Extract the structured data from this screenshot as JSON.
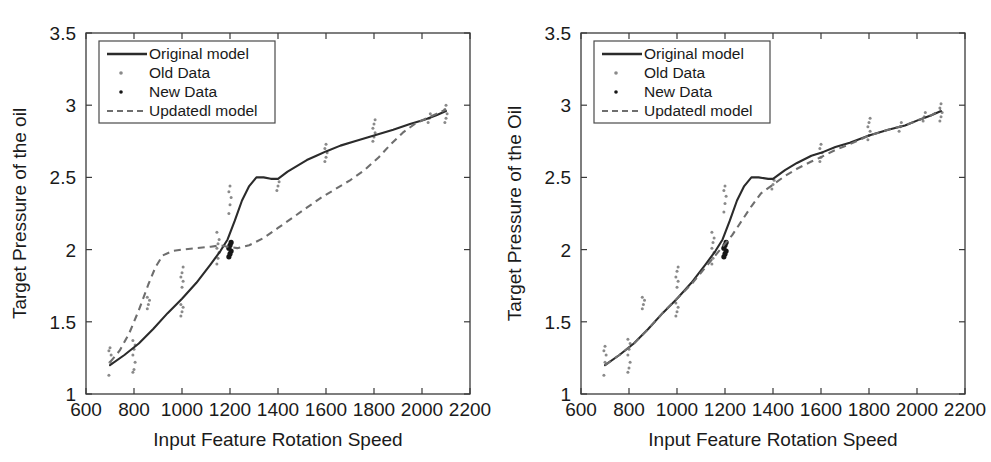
{
  "figure": {
    "panel_count": 2,
    "background": "#ffffff",
    "colors": {
      "original_model_line": "#2b2b2b",
      "updated_model_line": "#6e6e6e",
      "old_data_points": "#8a8a8a",
      "new_data_points": "#161616",
      "axis": "#3a3a3a",
      "text": "#1a1a1a"
    }
  },
  "chart_data": [
    {
      "id": "left",
      "type": "line",
      "title": "",
      "xlabel": "Input Feature Rotation Speed",
      "ylabel": "Target Pressure of the oil",
      "xlim": [
        600,
        2200
      ],
      "ylim": [
        1,
        3.5
      ],
      "xticks": [
        600,
        800,
        1000,
        1200,
        1400,
        1600,
        1800,
        2000,
        2200
      ],
      "xticklabels": [
        "600",
        "800",
        "1000",
        "1200",
        "1400",
        "1600",
        "1800",
        "2000",
        "2200"
      ],
      "yticks": [
        1,
        1.5,
        2,
        2.5,
        3,
        3.5
      ],
      "yticklabels": [
        "1",
        "1.5",
        "2",
        "2.5",
        "3",
        "3.5"
      ],
      "grid": false,
      "legend_position": "upper left",
      "legend_entries": [
        {
          "label": "Original model",
          "marker": "solid-line",
          "color": "#2b2b2b"
        },
        {
          "label": "Old Data",
          "marker": "dot",
          "color": "#8a8a8a"
        },
        {
          "label": "New Data",
          "marker": "dot",
          "color": "#161616"
        },
        {
          "label": "Updatedl model",
          "marker": "dashed-line",
          "color": "#6e6e6e"
        }
      ],
      "series": [
        {
          "name": "Original model",
          "style": "solid",
          "x": [
            700,
            760,
            820,
            880,
            940,
            1000,
            1060,
            1120,
            1160,
            1190,
            1220,
            1250,
            1280,
            1310,
            1340,
            1370,
            1400,
            1440,
            1480,
            1520,
            1560,
            1600,
            1660,
            1720,
            1800,
            1880,
            1950,
            2010,
            2060,
            2100
          ],
          "y": [
            1.2,
            1.27,
            1.35,
            1.45,
            1.56,
            1.66,
            1.77,
            1.9,
            1.99,
            2.07,
            2.2,
            2.34,
            2.44,
            2.5,
            2.5,
            2.49,
            2.49,
            2.54,
            2.58,
            2.62,
            2.65,
            2.68,
            2.72,
            2.75,
            2.79,
            2.83,
            2.87,
            2.9,
            2.93,
            2.96
          ]
        },
        {
          "name": "Updatedl model",
          "style": "dashed",
          "x": [
            700,
            740,
            780,
            820,
            860,
            890,
            920,
            960,
            1000,
            1060,
            1120,
            1160,
            1190,
            1230,
            1280,
            1340,
            1400,
            1460,
            1520,
            1580,
            1640,
            1700,
            1760,
            1820,
            1870,
            1920,
            1970,
            2020,
            2060,
            2100
          ],
          "y": [
            1.22,
            1.3,
            1.42,
            1.58,
            1.76,
            1.88,
            1.96,
            1.99,
            2.0,
            2.01,
            2.02,
            2.03,
            2.02,
            2.01,
            2.03,
            2.08,
            2.15,
            2.22,
            2.29,
            2.36,
            2.42,
            2.48,
            2.55,
            2.64,
            2.73,
            2.81,
            2.87,
            2.91,
            2.94,
            2.97
          ]
        }
      ],
      "old_data": [
        {
          "x": 700,
          "values": [
            1.13,
            1.22,
            1.27,
            1.3,
            1.32
          ]
        },
        {
          "x": 800,
          "values": [
            1.15,
            1.17,
            1.22,
            1.27,
            1.31,
            1.34,
            1.37
          ]
        },
        {
          "x": 860,
          "values": [
            1.59,
            1.62,
            1.65,
            1.67
          ]
        },
        {
          "x": 1000,
          "values": [
            1.54,
            1.57,
            1.6,
            1.62,
            1.74,
            1.78,
            1.81,
            1.84,
            1.88
          ]
        },
        {
          "x": 1150,
          "values": [
            1.9,
            1.94,
            1.98,
            2.01,
            2.04,
            2.07,
            2.12
          ]
        },
        {
          "x": 1200,
          "values": [
            2.25,
            2.31,
            2.36,
            2.4,
            2.44
          ]
        },
        {
          "x": 1400,
          "values": [
            2.41,
            2.44,
            2.47
          ]
        },
        {
          "x": 1600,
          "values": [
            2.61,
            2.64,
            2.67,
            2.7,
            2.73
          ]
        },
        {
          "x": 1800,
          "values": [
            2.75,
            2.78,
            2.81,
            2.84,
            2.87,
            2.9
          ]
        },
        {
          "x": 2030,
          "values": [
            2.88,
            2.91,
            2.94
          ]
        },
        {
          "x": 2100,
          "values": [
            2.88,
            2.91,
            2.94,
            2.97,
            3.0
          ]
        }
      ],
      "new_data": [
        {
          "x": 1200,
          "values": [
            1.95,
            1.97,
            1.99,
            2.01,
            2.03,
            2.05
          ]
        }
      ]
    },
    {
      "id": "right",
      "type": "line",
      "title": "",
      "xlabel": "Input Feature Rotation Speed",
      "ylabel": "Target Pressure of the Oil",
      "xlim": [
        600,
        2200
      ],
      "ylim": [
        1,
        3.5
      ],
      "xticks": [
        600,
        800,
        1000,
        1200,
        1400,
        1600,
        1800,
        2000,
        2200
      ],
      "xticklabels": [
        "600",
        "800",
        "1000",
        "1200",
        "1400",
        "1600",
        "1800",
        "2000",
        "2200"
      ],
      "yticks": [
        1,
        1.5,
        2,
        2.5,
        3,
        3.5
      ],
      "yticklabels": [
        "1",
        "1.5",
        "2",
        "2.5",
        "3",
        "3.5"
      ],
      "grid": false,
      "legend_position": "upper left",
      "legend_entries": [
        {
          "label": "Original model",
          "marker": "solid-line",
          "color": "#2b2b2b"
        },
        {
          "label": "Old Data",
          "marker": "dot",
          "color": "#8a8a8a"
        },
        {
          "label": "New Data",
          "marker": "dot",
          "color": "#161616"
        },
        {
          "label": "Updatedl model",
          "marker": "dashed-line",
          "color": "#6e6e6e"
        }
      ],
      "series": [
        {
          "name": "Original model",
          "style": "solid",
          "x": [
            700,
            760,
            820,
            880,
            940,
            1000,
            1060,
            1120,
            1160,
            1190,
            1220,
            1250,
            1280,
            1310,
            1340,
            1380,
            1400,
            1450,
            1500,
            1560,
            1600,
            1660,
            1720,
            1800,
            1880,
            1950,
            2010,
            2060,
            2100
          ],
          "y": [
            1.2,
            1.27,
            1.35,
            1.45,
            1.56,
            1.66,
            1.77,
            1.9,
            1.99,
            2.07,
            2.2,
            2.34,
            2.44,
            2.5,
            2.5,
            2.49,
            2.49,
            2.55,
            2.6,
            2.65,
            2.67,
            2.71,
            2.74,
            2.79,
            2.83,
            2.86,
            2.9,
            2.93,
            2.96
          ]
        },
        {
          "name": "Updatedl model",
          "style": "dashed",
          "x": [
            700,
            760,
            820,
            880,
            940,
            1000,
            1060,
            1120,
            1160,
            1190,
            1230,
            1270,
            1310,
            1350,
            1400,
            1450,
            1500,
            1560,
            1600,
            1660,
            1720,
            1800,
            1880,
            1950,
            2010,
            2060,
            2100
          ],
          "y": [
            1.2,
            1.27,
            1.35,
            1.45,
            1.56,
            1.66,
            1.76,
            1.88,
            1.96,
            2.02,
            2.1,
            2.2,
            2.3,
            2.39,
            2.45,
            2.51,
            2.56,
            2.61,
            2.64,
            2.69,
            2.73,
            2.79,
            2.83,
            2.86,
            2.9,
            2.93,
            2.97
          ]
        }
      ],
      "old_data": [
        {
          "x": 700,
          "values": [
            1.13,
            1.22,
            1.27,
            1.3,
            1.33
          ]
        },
        {
          "x": 800,
          "values": [
            1.15,
            1.18,
            1.22,
            1.27,
            1.31,
            1.35,
            1.38
          ]
        },
        {
          "x": 860,
          "values": [
            1.59,
            1.62,
            1.65,
            1.67
          ]
        },
        {
          "x": 1000,
          "values": [
            1.54,
            1.57,
            1.6,
            1.63,
            1.74,
            1.78,
            1.81,
            1.85,
            1.88
          ]
        },
        {
          "x": 1150,
          "values": [
            1.9,
            1.94,
            1.98,
            2.01,
            2.05,
            2.08,
            2.12
          ]
        },
        {
          "x": 1200,
          "values": [
            2.26,
            2.32,
            2.37,
            2.41,
            2.44
          ]
        },
        {
          "x": 1400,
          "values": [
            2.42,
            2.45,
            2.48
          ]
        },
        {
          "x": 1600,
          "values": [
            2.61,
            2.64,
            2.67,
            2.7,
            2.73
          ]
        },
        {
          "x": 1800,
          "values": [
            2.76,
            2.79,
            2.82,
            2.85,
            2.88,
            2.91
          ]
        },
        {
          "x": 1930,
          "values": [
            2.82,
            2.85,
            2.88
          ]
        },
        {
          "x": 2030,
          "values": [
            2.89,
            2.92,
            2.95
          ]
        },
        {
          "x": 2100,
          "values": [
            2.89,
            2.92,
            2.95,
            2.98,
            3.01
          ]
        }
      ],
      "new_data": [
        {
          "x": 1200,
          "values": [
            1.95,
            1.97,
            1.99,
            2.01,
            2.03,
            2.05
          ]
        }
      ]
    }
  ]
}
